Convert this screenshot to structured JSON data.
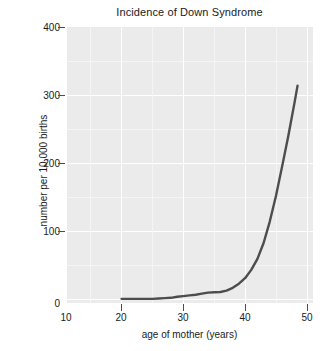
{
  "chart_data": {
    "type": "line",
    "title": "Incidence of Down Syndrome",
    "xlabel": "age of mother (years)",
    "ylabel": "number per 10,000 births",
    "xlim": [
      10,
      50
    ],
    "ylim": [
      0,
      400
    ],
    "xticks": [
      10,
      20,
      30,
      40,
      50
    ],
    "yticks": [
      0,
      100,
      200,
      300,
      400
    ],
    "xtick_labels": [
      "10",
      "20",
      "30",
      "40",
      "50"
    ],
    "ytick_labels": [
      "0",
      "100",
      "200",
      "300",
      "400"
    ],
    "grid": true,
    "legend": "none",
    "line_color": "#4d4d4d",
    "panel_color": "#ebebeb",
    "grid_color": "#ffffff",
    "series": [
      {
        "name": "incidence",
        "x": [
          19,
          20,
          21,
          22,
          23,
          24,
          25,
          26,
          27,
          28,
          29,
          30,
          31,
          32,
          33,
          34,
          35,
          36,
          37,
          38,
          39,
          40,
          41,
          42,
          43,
          44,
          45,
          46,
          47,
          47.5
        ],
        "values": [
          6,
          6,
          6,
          6,
          6,
          6,
          6.5,
          7,
          7.5,
          9,
          10,
          11,
          12,
          13.5,
          15,
          15.5,
          16,
          18,
          22,
          28,
          36,
          48,
          64,
          87,
          118,
          155,
          198,
          242,
          290,
          315
        ]
      }
    ]
  }
}
